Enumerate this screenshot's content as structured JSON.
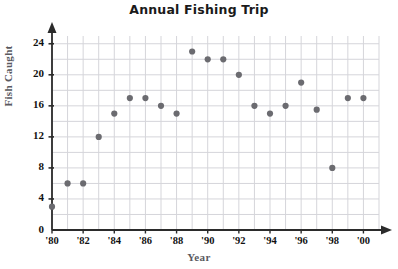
{
  "chart_data": {
    "type": "scatter",
    "title": "Annual Fishing Trip",
    "xlabel": "Year",
    "ylabel": "Fish Caught",
    "xlim": [
      1980,
      2000
    ],
    "ylim": [
      0,
      25
    ],
    "grid": true,
    "legend": "none",
    "y_ticks": [
      0,
      4,
      8,
      12,
      16,
      20,
      24
    ],
    "y_tick_labels": [
      "0",
      "4",
      "8",
      "12",
      "16",
      "20",
      "24"
    ],
    "y_gridlines": [
      2,
      4,
      6,
      8,
      10,
      12,
      14,
      16,
      18,
      20,
      22,
      24
    ],
    "x_ticks": [
      1980,
      1982,
      1984,
      1986,
      1988,
      1990,
      1992,
      1994,
      1996,
      1998,
      2000
    ],
    "x_tick_labels": [
      "'80",
      "'82",
      "'84",
      "'86",
      "'88",
      "'90",
      "'92",
      "'94",
      "'96",
      "'98",
      "'00"
    ],
    "x": [
      1980,
      1981,
      1982,
      1983,
      1984,
      1985,
      1986,
      1987,
      1988,
      1989,
      1990,
      1991,
      1992,
      1993,
      1994,
      1995,
      1996,
      1997,
      1998,
      1999,
      2000
    ],
    "values": [
      3,
      6,
      6,
      12,
      15,
      17,
      17,
      16,
      15,
      23,
      22,
      22,
      20,
      16,
      15,
      16,
      19,
      15.5,
      8,
      17,
      17
    ],
    "point_labels": [
      "'80",
      "'81",
      "'82",
      "'83",
      "'84",
      "'85",
      "'86",
      "'87",
      "'88",
      "'89",
      "'90",
      "'91",
      "'92",
      "'93",
      "'94",
      "'95",
      "'96",
      "'97",
      "'98",
      "'99",
      "'00"
    ],
    "marker_color": "#6b6b70",
    "grid_color": "#d5d5da",
    "axis_color": "#2b2b2b"
  }
}
